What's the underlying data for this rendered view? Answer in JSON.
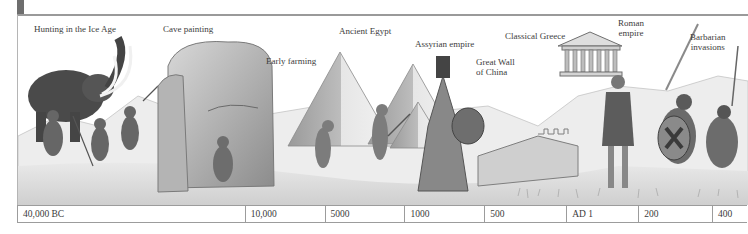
{
  "labels": [
    {
      "id": "ice-age",
      "text": "Hunting in the Ice Age",
      "x": 34,
      "y": 24
    },
    {
      "id": "cave-painting",
      "text": "Cave painting",
      "x": 163,
      "y": 24
    },
    {
      "id": "early-farming",
      "text": "Early farming",
      "x": 266,
      "y": 56
    },
    {
      "id": "ancient-egypt",
      "text": "Ancient Egypt",
      "x": 339,
      "y": 26
    },
    {
      "id": "assyrian-empire",
      "text": "Assyrian empire",
      "x": 415,
      "y": 39
    },
    {
      "id": "great-wall",
      "text": "Great Wall\nof China",
      "x": 476,
      "y": 57
    },
    {
      "id": "classical-greece",
      "text": "Classical Greece",
      "x": 505,
      "y": 31
    },
    {
      "id": "roman-empire",
      "text": "Roman\nempire",
      "x": 618,
      "y": 18
    },
    {
      "id": "barbarian-invasions",
      "text": "Barbarian\ninvasions",
      "x": 690,
      "y": 32
    }
  ],
  "timeline": {
    "cells": [
      {
        "label": "40,000 BC",
        "width": 228
      },
      {
        "label": "10,000",
        "width": 80
      },
      {
        "label": "5000",
        "width": 80
      },
      {
        "label": "1000",
        "width": 80
      },
      {
        "label": "500",
        "width": 82
      },
      {
        "label": "AD 1",
        "width": 72
      },
      {
        "label": "200",
        "width": 74
      },
      {
        "label": "400",
        "width": 34
      }
    ]
  },
  "colors": {
    "accent_bar": "#6e6e6e",
    "rule": "#9a9a9a",
    "text": "#3a3a3a"
  }
}
